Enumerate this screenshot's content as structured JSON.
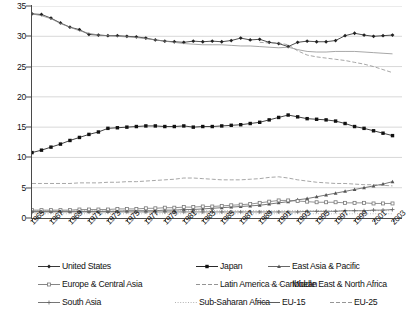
{
  "chart_data": {
    "type": "line",
    "title": "",
    "subtitle": "",
    "xlabel": "",
    "ylabel": "",
    "xlim": [
      1965,
      2004
    ],
    "ylim": [
      0,
      35
    ],
    "grid": true,
    "legend_position": "bottom",
    "y_ticks": [
      "0",
      "5",
      "10",
      "15",
      "20",
      "25",
      "30",
      "35"
    ],
    "y_tick_values": [
      0,
      5,
      10,
      15,
      20,
      25,
      30,
      35
    ],
    "x": [
      1965,
      1966,
      1967,
      1968,
      1969,
      1970,
      1971,
      1972,
      1973,
      1974,
      1975,
      1976,
      1977,
      1978,
      1979,
      1980,
      1981,
      1982,
      1983,
      1984,
      1985,
      1986,
      1987,
      1988,
      1989,
      1990,
      1991,
      1992,
      1993,
      1994,
      1995,
      1996,
      1997,
      1998,
      1999,
      2000,
      2001,
      2002,
      2003
    ],
    "x_tick_labels": [
      "1965",
      "1967",
      "1969",
      "1971",
      "1973",
      "1975",
      "1977",
      "1979",
      "1981",
      "1983",
      "1985",
      "1987",
      "1989",
      "1991",
      "1993",
      "1995",
      "1997",
      "1999",
      "2001",
      "2003"
    ],
    "x_tick_values": [
      1965,
      1967,
      1969,
      1971,
      1973,
      1975,
      1977,
      1979,
      1981,
      1983,
      1985,
      1987,
      1989,
      1991,
      1993,
      1995,
      1997,
      1999,
      2001,
      2003
    ],
    "series": [
      {
        "name": "United States",
        "marker": "diamond",
        "line_style": "solid",
        "color": "#222222",
        "values": [
          33.7,
          33.6,
          33.0,
          32.2,
          31.5,
          31.1,
          30.3,
          30.2,
          30.1,
          30.1,
          30.0,
          29.9,
          29.7,
          29.4,
          29.2,
          29.1,
          29.0,
          29.2,
          29.1,
          29.2,
          29.1,
          29.3,
          29.7,
          29.4,
          29.5,
          29.0,
          28.8,
          28.3,
          29.0,
          29.2,
          29.1,
          29.1,
          29.3,
          30.1,
          30.5,
          30.2,
          30.0,
          30.1,
          30.2
        ]
      },
      {
        "name": "Japan",
        "marker": "square-filled",
        "line_style": "solid",
        "color": "#111111",
        "values": [
          10.8,
          11.2,
          11.7,
          12.2,
          12.8,
          13.3,
          13.8,
          14.2,
          14.8,
          14.9,
          15.0,
          15.1,
          15.2,
          15.2,
          15.1,
          15.1,
          15.2,
          15.0,
          15.1,
          15.1,
          15.2,
          15.3,
          15.4,
          15.6,
          15.8,
          16.2,
          16.6,
          17.0,
          16.7,
          16.4,
          16.3,
          16.2,
          16.0,
          15.6,
          15.1,
          14.8,
          14.4,
          14.0,
          13.6
        ]
      },
      {
        "name": "East Asia & Pacific",
        "marker": "triangle",
        "line_style": "solid",
        "color": "#555555",
        "values": [
          1.1,
          1.1,
          1.1,
          1.1,
          1.1,
          1.1,
          1.1,
          1.1,
          1.1,
          1.1,
          1.2,
          1.2,
          1.2,
          1.2,
          1.3,
          1.3,
          1.4,
          1.4,
          1.5,
          1.6,
          1.7,
          1.8,
          1.9,
          2.0,
          2.1,
          2.3,
          2.5,
          2.7,
          3.0,
          3.2,
          3.5,
          3.8,
          4.1,
          4.4,
          4.7,
          5.0,
          5.3,
          5.6,
          6.0
        ]
      },
      {
        "name": "Europe & Central Asia",
        "marker": "square-open",
        "line_style": "solid",
        "color": "#777777",
        "values": [
          1.3,
          1.3,
          1.3,
          1.3,
          1.3,
          1.4,
          1.4,
          1.4,
          1.4,
          1.5,
          1.5,
          1.5,
          1.6,
          1.6,
          1.7,
          1.7,
          1.8,
          1.8,
          1.9,
          1.9,
          2.0,
          2.1,
          2.2,
          2.3,
          2.5,
          2.7,
          2.9,
          2.9,
          2.8,
          2.7,
          2.6,
          2.6,
          2.6,
          2.5,
          2.5,
          2.5,
          2.4,
          2.4,
          2.4
        ]
      },
      {
        "name": "Latin America & Caribbean",
        "marker": "none",
        "line_style": "dashed",
        "color": "#888888",
        "values": [
          5.7,
          5.7,
          5.7,
          5.7,
          5.7,
          5.8,
          5.8,
          5.8,
          5.9,
          5.9,
          6.0,
          6.0,
          6.1,
          6.2,
          6.3,
          6.4,
          6.6,
          6.6,
          6.5,
          6.4,
          6.3,
          6.3,
          6.3,
          6.4,
          6.5,
          6.7,
          6.8,
          6.6,
          6.3,
          6.1,
          5.9,
          5.8,
          5.7,
          5.7,
          5.6,
          5.5,
          5.5,
          5.4,
          5.3
        ]
      },
      {
        "name": "Middle East & North Africa",
        "marker": "none",
        "line_style": "dotted",
        "color": "#999999",
        "values": [
          1.2,
          1.2,
          1.2,
          1.2,
          1.2,
          1.2,
          1.2,
          1.2,
          1.2,
          1.2,
          1.2,
          1.2,
          1.2,
          1.2,
          1.2,
          1.2,
          1.2,
          1.2,
          1.2,
          1.2,
          1.2,
          1.2,
          1.2,
          1.2,
          1.2,
          1.2,
          1.2,
          1.2,
          1.2,
          1.2,
          1.2,
          1.2,
          1.2,
          1.2,
          1.2,
          1.2,
          1.2,
          1.2,
          1.2
        ]
      },
      {
        "name": "South Asia",
        "marker": "plus",
        "line_style": "solid",
        "color": "#666666",
        "values": [
          1.0,
          1.0,
          1.0,
          1.0,
          1.0,
          1.0,
          1.0,
          1.0,
          1.0,
          1.0,
          1.0,
          1.0,
          1.0,
          1.0,
          1.0,
          1.0,
          1.0,
          1.0,
          1.0,
          1.0,
          1.0,
          1.0,
          1.0,
          1.0,
          1.0,
          1.0,
          1.0,
          1.0,
          1.0,
          1.1,
          1.1,
          1.1,
          1.1,
          1.2,
          1.2,
          1.2,
          1.3,
          1.3,
          1.4
        ]
      },
      {
        "name": "Sub-Saharan Africa",
        "marker": "none",
        "line_style": "dotted",
        "color": "#aaaaaa",
        "values": [
          0.7,
          0.7,
          0.7,
          0.7,
          0.7,
          0.7,
          0.7,
          0.7,
          0.7,
          0.7,
          0.7,
          0.7,
          0.7,
          0.7,
          0.7,
          0.7,
          0.7,
          0.7,
          0.7,
          0.7,
          0.7,
          0.7,
          0.7,
          0.7,
          0.7,
          0.7,
          0.7,
          0.7,
          0.7,
          0.7,
          0.7,
          0.7,
          0.7,
          0.7,
          0.7,
          0.7,
          0.7,
          0.7,
          0.7
        ]
      },
      {
        "name": "EU-15",
        "marker": "none",
        "line_style": "solid",
        "color": "#8a8a8a",
        "values": [
          33.7,
          33.4,
          32.9,
          32.1,
          31.5,
          30.9,
          30.5,
          30.2,
          30.1,
          30.0,
          29.9,
          29.8,
          29.6,
          29.4,
          29.2,
          29.0,
          28.8,
          28.7,
          28.6,
          28.6,
          28.6,
          28.5,
          28.4,
          28.4,
          28.3,
          28.2,
          28.1,
          28.2,
          27.8,
          27.5,
          27.4,
          27.4,
          27.5,
          27.5,
          27.5,
          27.4,
          27.3,
          27.2,
          27.1
        ]
      },
      {
        "name": "EU-25",
        "marker": "none",
        "line_style": "dashed",
        "color": "#8a8a8a",
        "values": [
          null,
          null,
          null,
          null,
          null,
          null,
          null,
          null,
          null,
          null,
          null,
          null,
          null,
          null,
          null,
          null,
          null,
          null,
          null,
          null,
          null,
          null,
          null,
          null,
          29.0,
          28.9,
          28.9,
          28.6,
          27.6,
          26.9,
          26.6,
          26.4,
          26.2,
          26.0,
          25.7,
          25.4,
          25.0,
          24.5,
          24.0
        ]
      }
    ]
  },
  "legend": {
    "rows": [
      [
        {
          "label": "United States",
          "marker": "diamond",
          "line_style": "solid",
          "color": "#222222"
        },
        {
          "label": "Japan",
          "marker": "square-filled",
          "line_style": "solid",
          "color": "#111111"
        },
        {
          "label": "East Asia & Pacific",
          "marker": "triangle",
          "line_style": "solid",
          "color": "#555555"
        }
      ],
      [
        {
          "label": "Europe & Central Asia",
          "marker": "square-open",
          "line_style": "solid",
          "color": "#777777"
        },
        {
          "label": "Latin America & Caribbean",
          "marker": "none",
          "line_style": "dashed",
          "color": "#888888"
        },
        {
          "label": "Middle East & North Africa",
          "marker": "none",
          "line_style": "dotted",
          "color": "#999999"
        }
      ],
      [
        {
          "label": "South Asia",
          "marker": "plus",
          "line_style": "solid",
          "color": "#666666"
        },
        {
          "label": "Sub-Saharan Africa",
          "marker": "none",
          "line_style": "dotted",
          "color": "#aaaaaa"
        },
        {
          "label": "EU-15",
          "marker": "none",
          "line_style": "solid",
          "color": "#4a4a4a"
        },
        {
          "label": "EU-25",
          "marker": "none",
          "line_style": "dashed",
          "color": "#8a8a8a"
        }
      ]
    ]
  },
  "style": {
    "background": "#ffffff",
    "grid_color": "#d8d8d8",
    "axis_color": "#4a4a4a",
    "text_color": "#111111"
  }
}
